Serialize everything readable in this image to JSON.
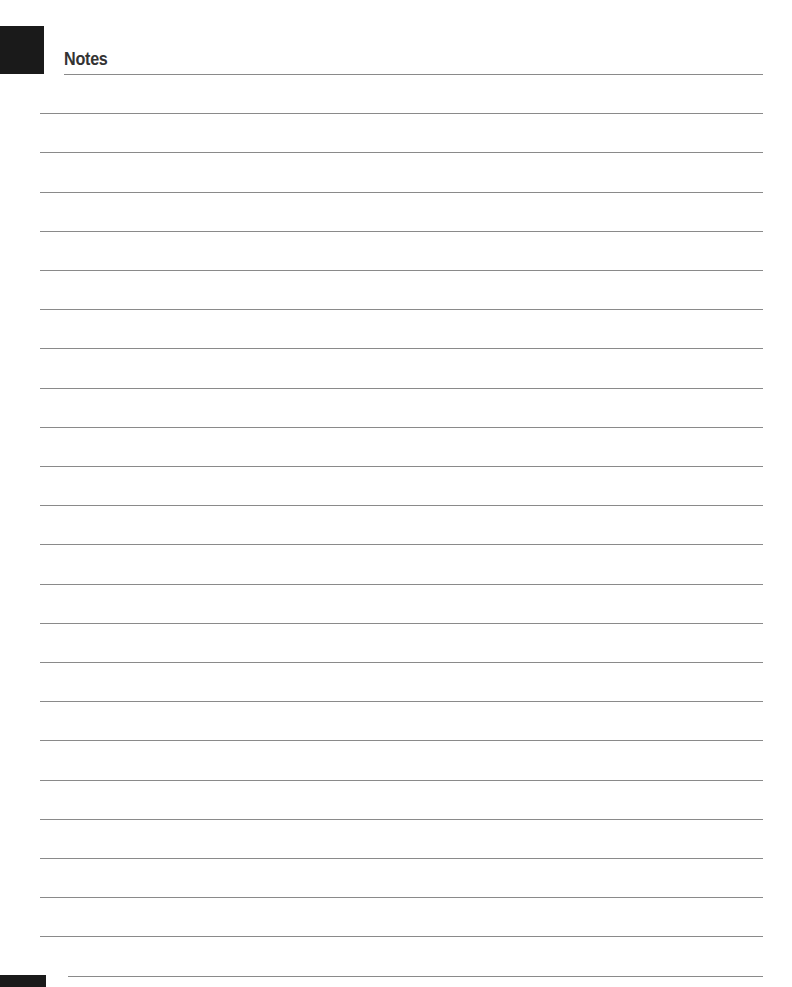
{
  "page": {
    "title": "Notes",
    "line_count": 24,
    "line_color": "#8a8a8a",
    "tab_color": "#1a1a1a"
  }
}
